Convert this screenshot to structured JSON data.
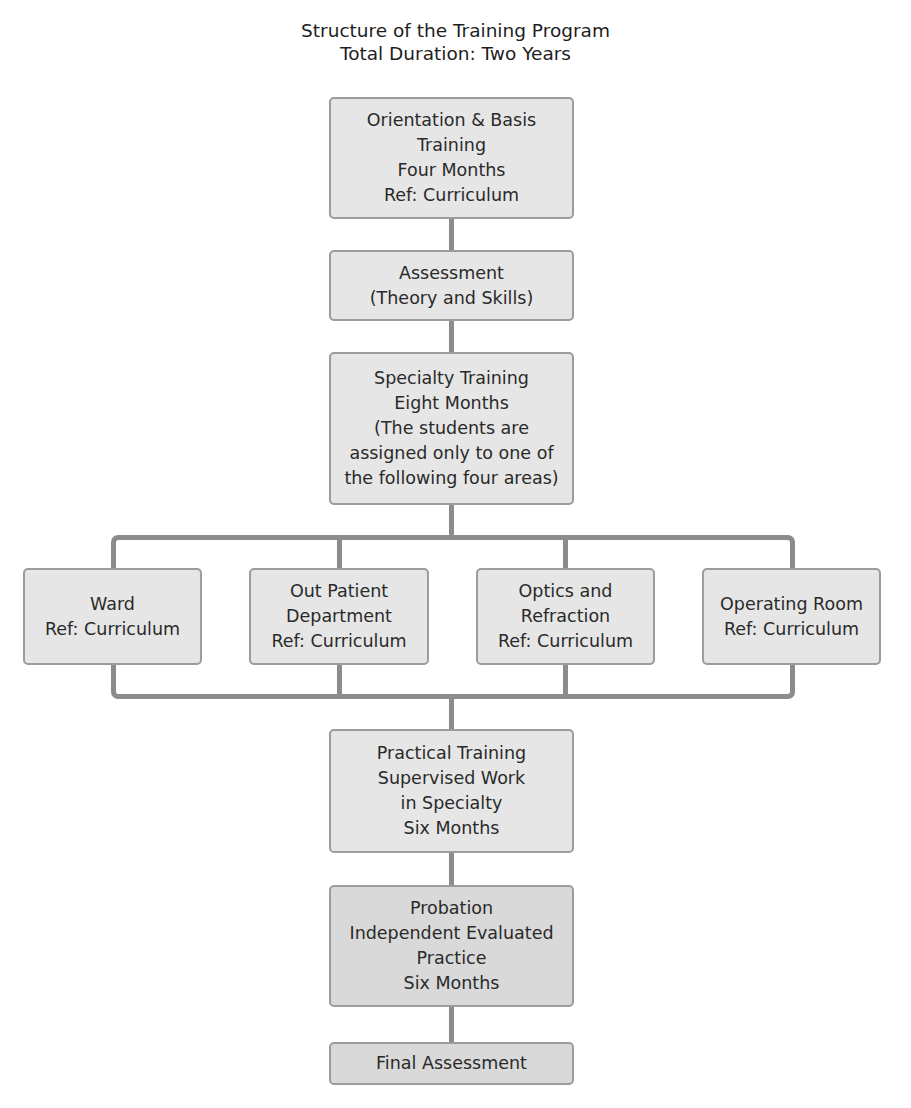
{
  "title": {
    "line1": "Structure of the Training Program",
    "line2": "Total Duration: Two Years"
  },
  "nodes": {
    "orientation": {
      "lines": [
        "Orientation & Basis",
        "Training",
        "Four Months",
        "Ref: Curriculum"
      ]
    },
    "assessment": {
      "lines": [
        "Assessment",
        "(Theory and Skills)"
      ]
    },
    "specialty": {
      "lines": [
        "Specialty Training",
        "Eight Months",
        "(The students are",
        "assigned only to one of",
        "the following four areas)"
      ]
    },
    "areas": [
      {
        "lines": [
          "Ward",
          "Ref: Curriculum"
        ]
      },
      {
        "lines": [
          "Out Patient",
          "Department",
          "Ref: Curriculum"
        ]
      },
      {
        "lines": [
          "Optics and",
          "Refraction",
          "Ref: Curriculum"
        ]
      },
      {
        "lines": [
          "Operating Room",
          "Ref: Curriculum"
        ]
      }
    ],
    "practical": {
      "lines": [
        "Practical Training",
        "Supervised Work",
        "in Specialty",
        "Six Months"
      ]
    },
    "probation": {
      "lines": [
        "Probation",
        "Independent Evaluated",
        "Practice",
        "Six Months"
      ]
    },
    "final": {
      "lines": [
        "Final Assessment"
      ]
    }
  },
  "colors": {
    "box_fill": "#e6e6e6",
    "box_fill_dark": "#d9d9d9",
    "box_border": "#9c9c9c",
    "connector": "#8c8c8c"
  }
}
